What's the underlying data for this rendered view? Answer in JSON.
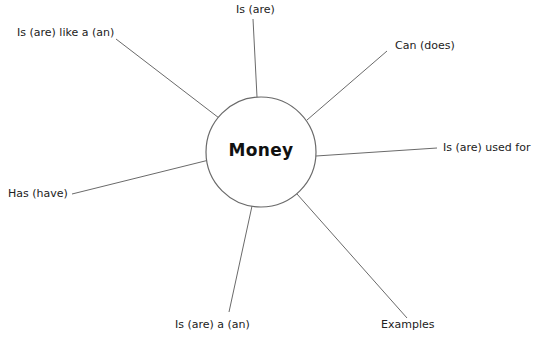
{
  "diagram": {
    "type": "concept-web",
    "center": {
      "label": "Money",
      "cx": 261,
      "cy": 152,
      "r": 55
    },
    "colors": {
      "line": "#6a6a6a",
      "text": "#222222",
      "background": "#ffffff"
    },
    "spokes": [
      {
        "id": "is-are",
        "label": "Is (are)",
        "x1": 253,
        "y1": 19,
        "x2": 257,
        "y2": 97,
        "lx": 236,
        "ly": 3
      },
      {
        "id": "is-like",
        "label": "Is (are) like a (an)",
        "x1": 116,
        "y1": 39,
        "x2": 219,
        "y2": 118,
        "lx": 17,
        "ly": 26
      },
      {
        "id": "can-does",
        "label": "Can (does)",
        "x1": 387,
        "y1": 51,
        "x2": 307,
        "y2": 120,
        "lx": 395,
        "ly": 39
      },
      {
        "id": "used-for",
        "label": "Is (are) used for",
        "x1": 437,
        "y1": 148,
        "x2": 316,
        "y2": 156,
        "lx": 443,
        "ly": 141
      },
      {
        "id": "has-have",
        "label": "Has (have)",
        "x1": 72,
        "y1": 194,
        "x2": 209,
        "y2": 160,
        "lx": 8,
        "ly": 187
      },
      {
        "id": "is-a",
        "label": "Is (are) a (an)",
        "x1": 229,
        "y1": 312,
        "x2": 252,
        "y2": 206,
        "lx": 175,
        "ly": 318
      },
      {
        "id": "examples",
        "label": "Examples",
        "x1": 407,
        "y1": 318,
        "x2": 297,
        "y2": 194,
        "lx": 381,
        "ly": 318
      }
    ]
  }
}
